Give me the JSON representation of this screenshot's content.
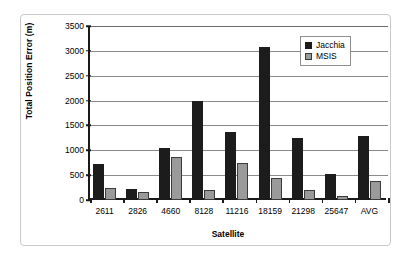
{
  "chart_data": {
    "type": "bar",
    "title": "",
    "xlabel": "Satellite",
    "ylabel": "Total Position Error (m)",
    "categories": [
      "2611",
      "2826",
      "4660",
      "8128",
      "11216",
      "18159",
      "21298",
      "25647",
      "AVG"
    ],
    "series": [
      {
        "name": "Jacchia",
        "color": "#1c1c1c",
        "values": [
          720,
          220,
          1040,
          1990,
          1370,
          3080,
          1250,
          520,
          1280
        ]
      },
      {
        "name": "MSIS",
        "color": "#9a9a9a",
        "values": [
          240,
          160,
          860,
          205,
          740,
          440,
          210,
          90,
          380
        ]
      }
    ],
    "ylim": [
      0,
      3500
    ],
    "ytick_labels": [
      "3500",
      "3000",
      "2500",
      "2000",
      "1500",
      "1000",
      "500",
      "0"
    ],
    "ytick_values": [
      3500,
      3000,
      2500,
      2000,
      1500,
      1000,
      500,
      0
    ],
    "grid": true,
    "legend_position": "top-right",
    "legend_entries": [
      "Jacchia",
      "MSIS"
    ]
  }
}
